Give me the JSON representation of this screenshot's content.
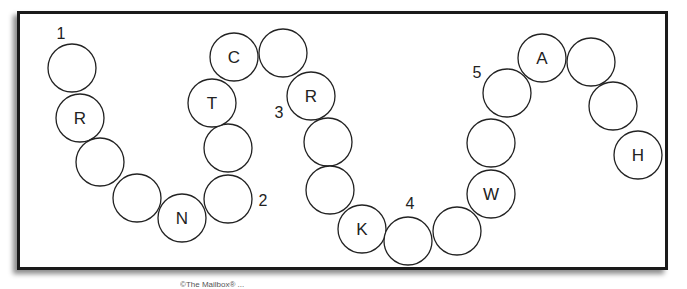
{
  "puzzle": {
    "circle_radius": 24,
    "circles": [
      {
        "x": 72,
        "y": 68,
        "letter": ""
      },
      {
        "x": 80,
        "y": 118,
        "letter": "R"
      },
      {
        "x": 100,
        "y": 162,
        "letter": ""
      },
      {
        "x": 137,
        "y": 198,
        "letter": ""
      },
      {
        "x": 182,
        "y": 218,
        "letter": "N"
      },
      {
        "x": 228,
        "y": 199,
        "letter": ""
      },
      {
        "x": 228,
        "y": 148,
        "letter": ""
      },
      {
        "x": 212,
        "y": 103,
        "letter": "T"
      },
      {
        "x": 234,
        "y": 57,
        "letter": "C"
      },
      {
        "x": 283,
        "y": 53,
        "letter": ""
      },
      {
        "x": 311,
        "y": 96,
        "letter": "R"
      },
      {
        "x": 328,
        "y": 142,
        "letter": ""
      },
      {
        "x": 330,
        "y": 190,
        "letter": ""
      },
      {
        "x": 362,
        "y": 229,
        "letter": "K"
      },
      {
        "x": 408,
        "y": 241,
        "letter": ""
      },
      {
        "x": 457,
        "y": 231,
        "letter": ""
      },
      {
        "x": 491,
        "y": 194,
        "letter": "W"
      },
      {
        "x": 491,
        "y": 143,
        "letter": ""
      },
      {
        "x": 507,
        "y": 93,
        "letter": ""
      },
      {
        "x": 542,
        "y": 58,
        "letter": "A"
      },
      {
        "x": 591,
        "y": 62,
        "letter": ""
      },
      {
        "x": 613,
        "y": 106,
        "letter": ""
      },
      {
        "x": 638,
        "y": 155,
        "letter": "H"
      }
    ],
    "markers": [
      {
        "label": "1",
        "x": 61,
        "y": 33
      },
      {
        "label": "2",
        "x": 263,
        "y": 200
      },
      {
        "label": "3",
        "x": 279,
        "y": 112
      },
      {
        "label": "4",
        "x": 410,
        "y": 203
      },
      {
        "label": "5",
        "x": 477,
        "y": 72
      }
    ]
  },
  "caption": "©The Mailbox® ..."
}
